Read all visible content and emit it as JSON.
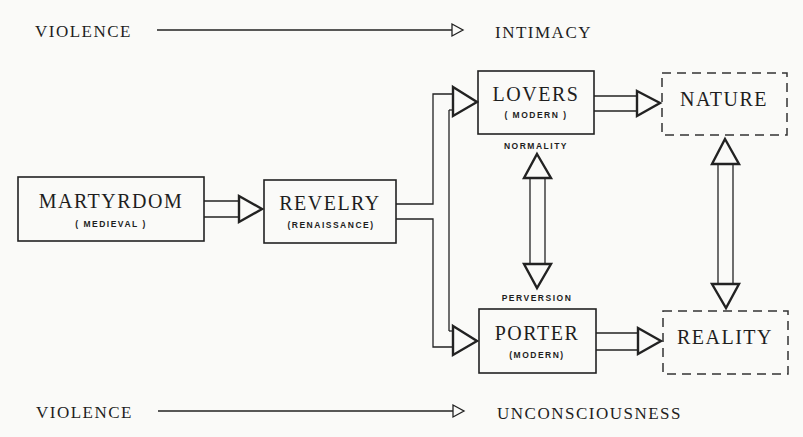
{
  "diagram": {
    "type": "flow",
    "axes": {
      "top": {
        "from": "VIOLENCE",
        "to": "INTIMACY"
      },
      "bottom": {
        "from": "VIOLENCE",
        "to": "UNCONSCIOUSNESS"
      }
    },
    "nodes": [
      {
        "id": "martyrdom",
        "label": "MARTYRDOM",
        "sublabel": "( MEDIEVAL )",
        "style": "solid"
      },
      {
        "id": "revelry",
        "label": "REVELRY",
        "sublabel": "(RENAISSANCE)",
        "style": "solid"
      },
      {
        "id": "lovers",
        "label": "LOVERS",
        "sublabel": "( MODERN )",
        "style": "solid"
      },
      {
        "id": "porter",
        "label": "PORTER",
        "sublabel": "(MODERN)",
        "style": "solid"
      },
      {
        "id": "nature",
        "label": "NATURE",
        "style": "dashed"
      },
      {
        "id": "reality",
        "label": "REALITY",
        "style": "dashed"
      }
    ],
    "edges": [
      {
        "from": "martyrdom",
        "to": "revelry",
        "type": "double-line-arrow"
      },
      {
        "from": "revelry",
        "to": "lovers",
        "type": "branch-arrow"
      },
      {
        "from": "revelry",
        "to": "porter",
        "type": "branch-arrow"
      },
      {
        "from": "lovers",
        "to": "nature",
        "type": "double-line-arrow"
      },
      {
        "from": "porter",
        "to": "reality",
        "type": "double-line-arrow"
      },
      {
        "from": "lovers",
        "to": "porter",
        "type": "bidirectional",
        "top_label": "NORMALITY",
        "bottom_label": "PERVERSION"
      },
      {
        "from": "nature",
        "to": "reality",
        "type": "bidirectional"
      }
    ]
  },
  "labels": {
    "top_violence": "VIOLENCE",
    "top_intimacy": "INTIMACY",
    "bottom_violence": "VIOLENCE",
    "bottom_unconsciousness": "UNCONSCIOUSNESS",
    "martyrdom": "MARTYRDOM",
    "martyrdom_sub": "( MEDIEVAL )",
    "revelry": "REVELRY",
    "revelry_sub": "(RENAISSANCE)",
    "lovers": "LOVERS",
    "lovers_sub": "( MODERN )",
    "porter": "PORTER",
    "porter_sub": "(MODERN)",
    "nature": "NATURE",
    "reality": "REALITY",
    "normality": "NORMALITY",
    "perversion": "PERVERSION"
  }
}
